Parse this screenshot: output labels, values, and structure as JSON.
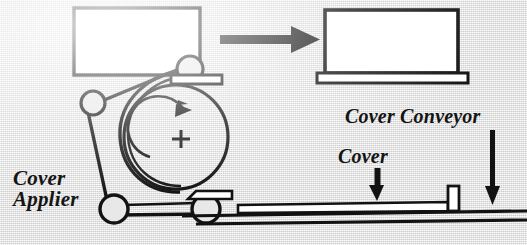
{
  "figure": {
    "background_color": "#e8e8e8",
    "ink_color": "#121212",
    "fill_color": "#ffffff",
    "width": 527,
    "height": 245
  },
  "labels": {
    "cover_applier_line1": "Cover",
    "cover_applier_line2": "Applier",
    "cover_conveyor": "Cover Conveyor",
    "cover": "Cover"
  },
  "annotations": {
    "drum_center_mark": "+",
    "transfer_arrow": "arrow-right",
    "cover_pointer": "arrow-down",
    "cover_conveyor_pointer": "arrow-down",
    "drum_rotation": "clockwise"
  },
  "parts": [
    {
      "name": "book-block-infeed",
      "shape": "rectangle",
      "fill": "#ffffff"
    },
    {
      "name": "applier-drum",
      "shape": "circle",
      "fill": "none"
    },
    {
      "name": "applier-belt",
      "shape": "path",
      "fill": "none"
    },
    {
      "name": "idler-roller-upper",
      "shape": "circle",
      "fill": "none"
    },
    {
      "name": "idler-roller-left",
      "shape": "circle",
      "fill": "none"
    },
    {
      "name": "idler-roller-bottom-left",
      "shape": "circle",
      "fill": "none"
    },
    {
      "name": "idler-roller-bottom-right",
      "shape": "circle",
      "fill": "none"
    },
    {
      "name": "guide-plate",
      "shape": "bar",
      "fill": "#ffffff"
    },
    {
      "name": "book-block-outfeed",
      "shape": "rectangle",
      "fill": "#ffffff"
    },
    {
      "name": "outfeed-platform",
      "shape": "bar",
      "fill": "#ffffff"
    },
    {
      "name": "cover-sheet",
      "shape": "bar",
      "fill": "#ffffff"
    },
    {
      "name": "conveyor-belt",
      "shape": "line",
      "fill": "none"
    },
    {
      "name": "conveyor-lug",
      "shape": "rectangle",
      "fill": "#ffffff"
    }
  ]
}
